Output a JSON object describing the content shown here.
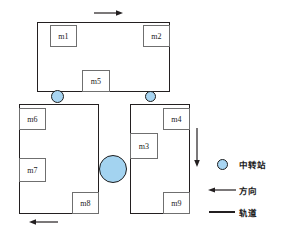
{
  "diagram": {
    "colors": {
      "track": "#231f20",
      "machine_border": "#6f6f6f",
      "station_fill": "#a8d5f2",
      "station_border": "#1d1d1d",
      "background": "#ffffff"
    },
    "tracks": [
      {
        "id": "track-top",
        "name": "top-loop-track",
        "x": 37,
        "y": 22,
        "w": 133,
        "h": 70
      },
      {
        "id": "track-lower-left",
        "name": "lower-left-loop-track",
        "x": 19,
        "y": 104,
        "w": 80,
        "h": 110
      },
      {
        "id": "track-lower-right",
        "name": "lower-right-loop-track",
        "x": 130,
        "y": 104,
        "w": 60,
        "h": 110
      }
    ],
    "machines": [
      {
        "id": "m1",
        "label": "m1",
        "x": 50,
        "y": 25,
        "w": 27,
        "h": 22
      },
      {
        "id": "m2",
        "label": "m2",
        "x": 143,
        "y": 25,
        "w": 27,
        "h": 22
      },
      {
        "id": "m5",
        "label": "m5",
        "x": 82,
        "y": 70,
        "w": 28,
        "h": 22
      },
      {
        "id": "m6",
        "label": "m6",
        "x": 19,
        "y": 108,
        "w": 27,
        "h": 22
      },
      {
        "id": "m7",
        "label": "m7",
        "x": 19,
        "y": 158,
        "w": 27,
        "h": 24
      },
      {
        "id": "m8",
        "label": "m8",
        "x": 72,
        "y": 192,
        "w": 27,
        "h": 22
      },
      {
        "id": "m3",
        "label": "m3",
        "x": 130,
        "y": 133,
        "w": 28,
        "h": 26
      },
      {
        "id": "m4",
        "label": "m4",
        "x": 163,
        "y": 108,
        "w": 27,
        "h": 22
      },
      {
        "id": "m9",
        "label": "m9",
        "x": 163,
        "y": 192,
        "w": 27,
        "h": 22
      }
    ],
    "stations": [
      {
        "id": "station-left",
        "name": "transfer-station-left",
        "cx": 57,
        "cy": 96,
        "r": 6.5
      },
      {
        "id": "station-right",
        "name": "transfer-station-right",
        "cx": 150,
        "cy": 96,
        "r": 5.5
      },
      {
        "id": "station-mid",
        "name": "transfer-station-middle",
        "cx": 113,
        "cy": 169,
        "r": 14
      }
    ],
    "arrows": [
      {
        "id": "arrow-top",
        "name": "direction-arrow-top",
        "x": 94,
        "y": 13,
        "length": 24,
        "dir": "right"
      },
      {
        "id": "arrow-bottom",
        "name": "direction-arrow-bottom",
        "x": 30,
        "y": 222,
        "length": 24,
        "dir": "left"
      },
      {
        "id": "arrow-right",
        "name": "direction-arrow-right",
        "x": 197,
        "y": 130,
        "length": 33,
        "dir": "down"
      }
    ]
  },
  "legend": {
    "items": [
      {
        "id": "legend-station",
        "symbol": "circle",
        "label": "中转站"
      },
      {
        "id": "legend-direction",
        "symbol": "arrow",
        "label": "方向"
      },
      {
        "id": "legend-track",
        "symbol": "line",
        "label": "轨道"
      }
    ]
  }
}
